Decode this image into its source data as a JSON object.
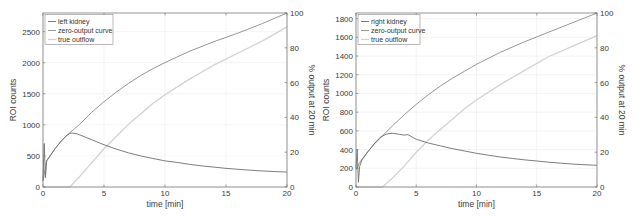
{
  "chart_data": [
    {
      "type": "line",
      "panel": "left",
      "title": "",
      "xlabel": "time [min]",
      "ylabel": "ROI counts",
      "ylabel_right": "% output at 20 min",
      "xlim": [
        0,
        20
      ],
      "ylim": [
        0,
        2800
      ],
      "ylim_right": [
        0,
        100
      ],
      "x_ticks": [
        0,
        5,
        10,
        15,
        20
      ],
      "y_ticks": [
        0,
        500,
        1000,
        1500,
        2000,
        2500
      ],
      "y_ticks_right": [
        0,
        20,
        40,
        60,
        80,
        100
      ],
      "grid": true,
      "legend_position": "upper left",
      "legend": [
        "left kidney",
        "zero-output curve",
        "true outflow"
      ],
      "series": [
        {
          "name": "left kidney",
          "axis": "left",
          "color": "#6e6e6e",
          "x": [
            0,
            0.1,
            0.2,
            0.3,
            0.5,
            1.0,
            1.5,
            2.0,
            2.3,
            2.7,
            3.0,
            4.0,
            5.0,
            6.0,
            7.0,
            8.0,
            9.0,
            10.0,
            11.0,
            12.0,
            13.0,
            14.0,
            15.0,
            16.0,
            17.0,
            18.0,
            19.0,
            20.0
          ],
          "y": [
            100,
            700,
            150,
            420,
            480,
            620,
            740,
            840,
            870,
            860,
            840,
            760,
            680,
            610,
            550,
            500,
            460,
            420,
            395,
            365,
            340,
            320,
            300,
            285,
            270,
            258,
            248,
            240
          ]
        },
        {
          "name": "zero-output curve",
          "axis": "right",
          "color": "#8a8a8a",
          "x": [
            0,
            0.3,
            0.5,
            1.0,
            1.5,
            2.0,
            2.5,
            3.0,
            4.0,
            5.0,
            6.0,
            7.0,
            8.0,
            9.0,
            10.0,
            12.0,
            14.0,
            16.0,
            18.0,
            20.0
          ],
          "y": [
            3.6,
            15,
            17,
            22,
            26.5,
            30,
            33,
            36,
            43,
            49,
            54.5,
            59.5,
            64,
            68,
            71.5,
            78,
            83.5,
            88.5,
            94,
            100
          ]
        },
        {
          "name": "true outflow",
          "axis": "right",
          "color": "#d2d2d2",
          "x": [
            0,
            2.2,
            3.0,
            4.0,
            5.0,
            6.0,
            7.0,
            8.0,
            9.0,
            10.0,
            12.0,
            14.0,
            16.0,
            18.0,
            20.0
          ],
          "y": [
            0,
            0,
            6,
            14,
            22,
            29,
            36,
            42,
            48,
            53,
            62,
            70,
            77,
            84,
            92
          ]
        }
      ]
    },
    {
      "type": "line",
      "panel": "right",
      "title": "",
      "xlabel": "time [min]",
      "ylabel": "ROI counts",
      "ylabel_right": "% output at 20 min",
      "xlim": [
        0,
        20
      ],
      "ylim": [
        0,
        1860
      ],
      "ylim_right": [
        0,
        100
      ],
      "x_ticks": [
        0,
        5,
        10,
        15,
        20
      ],
      "y_ticks": [
        0,
        200,
        400,
        600,
        800,
        1000,
        1200,
        1400,
        1600,
        1800
      ],
      "y_ticks_right": [
        0,
        20,
        40,
        60,
        80,
        100
      ],
      "grid": true,
      "legend_position": "upper left",
      "legend": [
        "right kidney",
        "zero-output curve",
        "true outflow"
      ],
      "series": [
        {
          "name": "right kidney",
          "axis": "left",
          "color": "#6e6e6e",
          "x": [
            0,
            0.1,
            0.2,
            0.3,
            0.5,
            1.0,
            1.5,
            2.0,
            2.5,
            3.0,
            3.5,
            4.0,
            4.3,
            5.0,
            6.0,
            7.0,
            8.0,
            9.0,
            10.0,
            11.0,
            12.0,
            13.0,
            14.0,
            15.0,
            16.0,
            17.0,
            18.0,
            19.0,
            20.0
          ],
          "y": [
            200,
            400,
            50,
            220,
            290,
            380,
            460,
            530,
            565,
            575,
            565,
            555,
            560,
            510,
            470,
            440,
            410,
            385,
            360,
            340,
            320,
            305,
            290,
            278,
            265,
            255,
            245,
            238,
            232
          ]
        },
        {
          "name": "zero-output curve",
          "axis": "right",
          "color": "#8a8a8a",
          "x": [
            0,
            0.3,
            0.5,
            1.0,
            1.5,
            2.0,
            2.5,
            3.0,
            4.0,
            5.0,
            6.0,
            7.0,
            8.0,
            9.0,
            10.0,
            12.0,
            14.0,
            16.0,
            18.0,
            20.0
          ],
          "y": [
            10,
            14,
            16,
            20.5,
            24.5,
            28,
            31.5,
            35,
            41.5,
            47.5,
            53,
            58,
            62.5,
            66.5,
            70.5,
            77.5,
            83.5,
            89,
            94.5,
            100
          ]
        },
        {
          "name": "true outflow",
          "axis": "right",
          "color": "#d2d2d2",
          "x": [
            0,
            2.2,
            3.0,
            4.0,
            5.0,
            6.0,
            7.0,
            8.0,
            9.0,
            10.0,
            12.0,
            14.0,
            16.0,
            18.0,
            20.0
          ],
          "y": [
            0,
            0,
            5,
            12,
            20,
            27,
            33,
            39,
            45,
            50,
            59,
            67,
            75,
            81,
            87
          ]
        }
      ]
    }
  ],
  "figure": {
    "panels": [
      {
        "id": "left",
        "box": {
          "x0": 43,
          "x1": 287,
          "y0": 13,
          "y1": 187
        },
        "xlabel": "time [min]",
        "ylabel": "ROI counts",
        "ylabel_right": "% output at 20 min",
        "legend": [
          "left kidney",
          "zero-output curve",
          "true outflow"
        ]
      },
      {
        "id": "right",
        "box": {
          "x0": 356,
          "x1": 597,
          "y0": 13,
          "y1": 187
        },
        "xlabel": "time [min]",
        "ylabel": "ROI counts",
        "ylabel_right": "% output at 20 min",
        "legend": [
          "right kidney",
          "zero-output curve",
          "true outflow"
        ]
      }
    ]
  }
}
